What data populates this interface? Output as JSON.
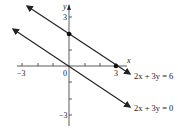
{
  "figure": {
    "axes": {
      "x_label": "x",
      "y_label": "y",
      "x_ticks": [
        "-3",
        "0",
        "3"
      ],
      "y_ticks": [
        "3",
        "-3"
      ],
      "x_range": [
        -3.3,
        3.8
      ],
      "y_range": [
        -3.8,
        3.9
      ]
    },
    "lines": [
      {
        "equation": "2x + 3y = 6",
        "points": [
          [
            0,
            2
          ],
          [
            3,
            0
          ]
        ]
      },
      {
        "equation": "2x + 3y = 0",
        "points": [
          [
            0,
            0
          ]
        ]
      }
    ],
    "labels": {
      "line1": "2x + 3y = 6",
      "line2": "2x + 3y = 0",
      "tick_x_neg3": "−3",
      "tick_x_0": "0",
      "tick_x_3": "3",
      "tick_y_3": "3",
      "tick_y_neg3": "−3"
    },
    "colors": {
      "ink": "#222222",
      "background": "#ffffff"
    }
  }
}
